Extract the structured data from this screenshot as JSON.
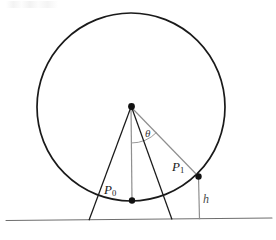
{
  "figure": {
    "type": "geometry-diagram",
    "background_color": "#ffffff",
    "stroke_color_primary": "#1a1a1a",
    "stroke_color_secondary": "#8c8c8c",
    "labels": {
      "p0": "P",
      "p0_sub": "0",
      "p1": "P",
      "p1_sub": "1",
      "height": "h",
      "angle": "θ"
    },
    "elements": {
      "circle": {
        "name": "rolling-circle",
        "cx": 131,
        "cy": 107,
        "r": 94
      },
      "center_point": {
        "name": "circle-center",
        "x": 131,
        "y": 106.5
      },
      "p0_point": {
        "name": "point-p0",
        "x": 132,
        "y": 200.5
      },
      "p1_point": {
        "name": "point-p1",
        "x": 198,
        "y": 176
      },
      "ground_line": {
        "name": "ground-line",
        "x1": 6,
        "y1": 220.5,
        "x2": 272,
        "y2": 218.0
      },
      "radius_to_p0": {
        "name": "radius-to-p0",
        "x1": 131,
        "y1": 107,
        "x2": 132,
        "y2": 200.5
      },
      "radius_to_p1": {
        "name": "radius-to-p1",
        "x1": 131,
        "y1": 107,
        "x2": 198,
        "y2": 176
      },
      "height_drop": {
        "name": "height-drop-line",
        "x1": 198,
        "y1": 176,
        "x2": 199,
        "y2": 219
      },
      "angle_arc": {
        "name": "angle-arc-theta",
        "radius": 36,
        "start_deg": 270,
        "end_deg": 314
      },
      "leg_left": {
        "name": "triangle-leg-left",
        "x1": 131,
        "y1": 107,
        "x2": 89,
        "y2": 220
      },
      "leg_right": {
        "name": "triangle-leg-right",
        "x1": 131,
        "y1": 107,
        "x2": 172,
        "y2": 219
      }
    }
  }
}
